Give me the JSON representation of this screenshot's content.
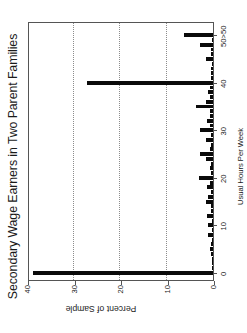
{
  "chart_data": {
    "type": "bar",
    "title": "Secondary Wage Earners in Two Parent Families",
    "subtitle": "",
    "xlabel": "Usual Hours Per Week",
    "ylabel": "Percent of Sample",
    "xlim": [
      -1.5,
      53
    ],
    "ylim": [
      0,
      40
    ],
    "xticks": [
      0,
      10,
      20,
      30,
      40,
      50
    ],
    "xticklabels": [
      "0",
      "10",
      "20",
      "30",
      "40",
      "50>50"
    ],
    "yticks": [
      0,
      10,
      20,
      30,
      40
    ],
    "yticklabels": [
      "0",
      "10",
      "20",
      "30",
      "40"
    ],
    "grid": "horizontal-dotted",
    "legend": "none",
    "bar_color": "#0a0a0a",
    "orientation": "rotated-90",
    "x": [
      0,
      1,
      2,
      3,
      4,
      5,
      6,
      7,
      8,
      9,
      10,
      11,
      12,
      13,
      14,
      15,
      16,
      17,
      18,
      19,
      20,
      21,
      22,
      23,
      24,
      25,
      26,
      27,
      28,
      29,
      30,
      31,
      32,
      33,
      34,
      35,
      36,
      37,
      38,
      39,
      40,
      41,
      42,
      43,
      44,
      45,
      46,
      47,
      48,
      49,
      50
    ],
    "values": [
      38.8,
      0.1,
      0.2,
      0.3,
      0.4,
      0.7,
      0.5,
      0.3,
      1.0,
      0.3,
      1.1,
      0.3,
      1.2,
      0.4,
      0.5,
      1.6,
      1.1,
      0.5,
      1.2,
      0.6,
      3.1,
      0.5,
      0.7,
      0.5,
      1.6,
      2.7,
      0.7,
      0.5,
      1.6,
      0.5,
      2.7,
      0.6,
      1.4,
      0.7,
      0.6,
      3.6,
      1.5,
      0.6,
      1.1,
      0.6,
      27.0,
      0.4,
      0.5,
      0.4,
      0.3,
      1.5,
      0.4,
      0.4,
      2.7,
      0.3,
      6.2
    ],
    "categories": [
      "0",
      "1",
      "2",
      "3",
      "4",
      "5",
      "6",
      "7",
      "8",
      "9",
      "10",
      "11",
      "12",
      "13",
      "14",
      "15",
      "16",
      "17",
      "18",
      "19",
      "20",
      "21",
      "22",
      "23",
      "24",
      "25",
      "26",
      "27",
      "28",
      "29",
      "30",
      "31",
      "32",
      "33",
      "34",
      "35",
      "36",
      "37",
      "38",
      "39",
      "40",
      "41",
      "42",
      "43",
      "44",
      "45",
      "46",
      "47",
      "48",
      "49",
      "50>50"
    ],
    "annotations": []
  }
}
